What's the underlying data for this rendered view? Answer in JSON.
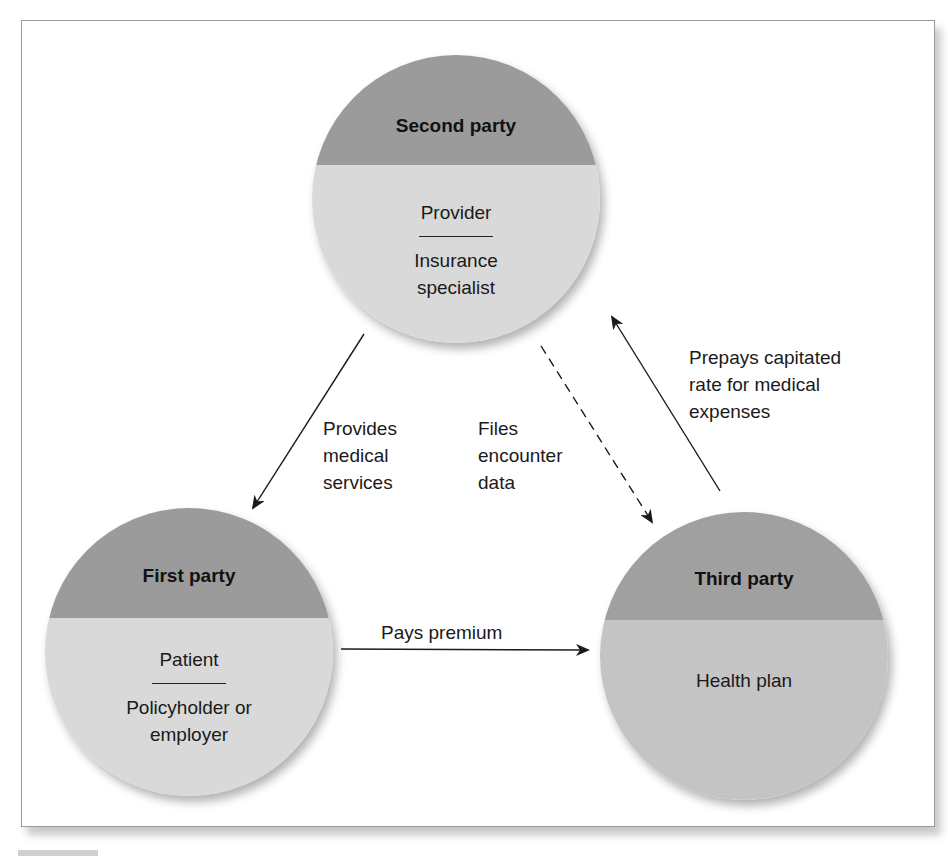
{
  "diagram": {
    "type": "three-party payment relationship",
    "colors": {
      "circle_top": "#9b9b9b",
      "circle_bottom": "#d9d9d9",
      "third_party_top": "#a0a0a0",
      "third_party_bottom": "#c4c4c4",
      "frame_border": "#9a9a9a",
      "arrow": "#1a1a1a"
    },
    "nodes": {
      "second_party": {
        "title": "Second party",
        "primary_role": "Provider",
        "secondary_role": "Insurance specialist"
      },
      "first_party": {
        "title": "First party",
        "primary_role": "Patient",
        "secondary_role": "Policyholder or employer"
      },
      "third_party": {
        "title": "Third party",
        "primary_role": "Health plan"
      }
    },
    "edges": [
      {
        "from": "second_party",
        "to": "first_party",
        "style": "solid",
        "label": "Provides\nmedical\nservices"
      },
      {
        "from": "second_party",
        "to": "third_party",
        "style": "dashed",
        "label": "Files\nencounter\ndata"
      },
      {
        "from": "third_party",
        "to": "second_party",
        "style": "solid",
        "label": "Prepays capitated\nrate for medical\nexpenses"
      },
      {
        "from": "first_party",
        "to": "third_party",
        "style": "solid",
        "label": "Pays premium"
      }
    ]
  }
}
